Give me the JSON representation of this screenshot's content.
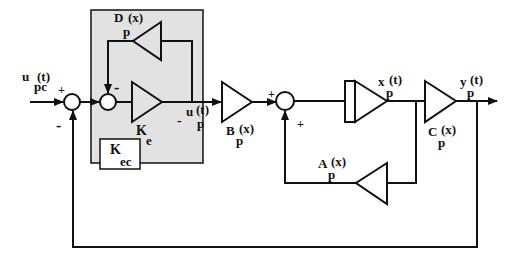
{
  "diagram": {
    "type": "block-diagram",
    "colors": {
      "line": "#111111",
      "shaded_region": "#e2e2e2",
      "background": "#ffffff"
    },
    "signals": {
      "input": {
        "main": "u",
        "sub": "pc",
        "arg": "(t)"
      },
      "control": {
        "main": "u",
        "sub": "p",
        "arg": "(t)"
      },
      "state": {
        "main": "x",
        "sub": "p",
        "arg": "(t)"
      },
      "output": {
        "main": "y",
        "sub": "p",
        "arg": "(t)"
      }
    },
    "blocks": {
      "D": {
        "main": "D",
        "sub": "p",
        "arg": "(x)"
      },
      "Ke": {
        "main": "K",
        "sub": "e"
      },
      "Kec": {
        "main": "K",
        "sub": "ec"
      },
      "B": {
        "main": "B",
        "sub": "p",
        "arg": "(x)"
      },
      "A": {
        "main": "A",
        "sub": "p",
        "arg": "(x)"
      },
      "C": {
        "main": "C",
        "sub": "p",
        "arg": "(x)"
      }
    },
    "signs": {
      "sum1_plus": "+",
      "sum1_minus": "-",
      "sum2_minus": "-",
      "control_minus": "-",
      "sum3_plus_left": "+",
      "sum3_plus_bottom": "+"
    }
  }
}
